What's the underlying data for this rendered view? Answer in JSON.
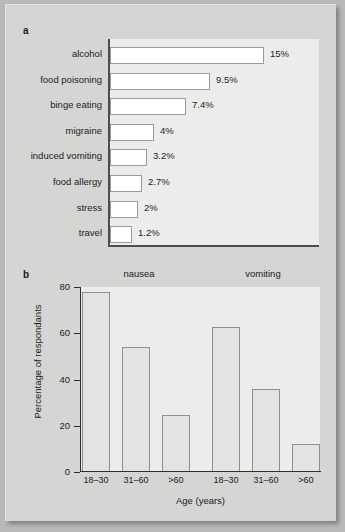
{
  "figure": {
    "panel_a_letter": "a",
    "panel_b_letter": "b"
  },
  "chart_data": [
    {
      "id": "panel-a",
      "type": "bar",
      "orientation": "horizontal",
      "title": "",
      "xlabel": "",
      "ylabel": "",
      "grid": false,
      "legend": "none",
      "axis_visible": [
        "left",
        "bottom"
      ],
      "value_label_suffix": "%",
      "categories": [
        "alcohol",
        "food poisoning",
        "binge eating",
        "migraine",
        "induced vomiting",
        "food allergy",
        "stress",
        "travel"
      ],
      "values": [
        15,
        9.5,
        7.4,
        4,
        3.2,
        2.7,
        2,
        1.2
      ],
      "value_labels": [
        "15%",
        "9.5%",
        "7.4%",
        "4%",
        "3.2%",
        "2.7%",
        "2%",
        "1.2%"
      ],
      "bar_pixel_widths": [
        154,
        100,
        76,
        44,
        37,
        32,
        28,
        22
      ]
    },
    {
      "id": "panel-b",
      "type": "bar",
      "orientation": "vertical",
      "title": "",
      "xlabel": "Age (years)",
      "ylabel": "Percentage of respondants",
      "ylim": [
        0,
        80
      ],
      "yticks": [
        0,
        20,
        40,
        60,
        80
      ],
      "ytick_labels": [
        "0",
        "20",
        "40",
        "60",
        "80"
      ],
      "grid": false,
      "group_titles": [
        "nausea",
        "vomiting"
      ],
      "categories": [
        "18–30",
        "31–60",
        ">60"
      ],
      "series": [
        {
          "name": "nausea",
          "values": [
            78,
            54,
            24.5
          ]
        },
        {
          "name": "vomiting",
          "values": [
            62.5,
            36,
            12
          ]
        }
      ]
    }
  ]
}
